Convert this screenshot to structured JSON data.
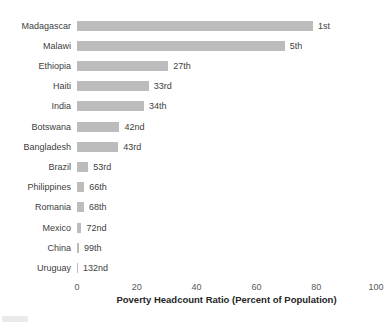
{
  "chart_data": {
    "type": "bar",
    "orientation": "horizontal",
    "title": "",
    "xlabel": "Poverty Headcount Ratio (Percent of Population)",
    "ylabel": "",
    "xlim": [
      0,
      100
    ],
    "x_ticks": [
      0,
      20,
      40,
      60,
      80,
      100
    ],
    "grid": false,
    "legend": false,
    "bar_color": "#bcbcbc",
    "label_color": "#404040",
    "categories": [
      "Madagascar",
      "Malawi",
      "Ethiopia",
      "Haiti",
      "India",
      "Botswana",
      "Bangladesh",
      "Brazil",
      "Philippines",
      "Romania",
      "Mexico",
      "China",
      "Uruguay"
    ],
    "values": [
      78.9,
      69.5,
      30.5,
      24.0,
      22.4,
      14.2,
      13.8,
      3.8,
      2.4,
      2.3,
      1.5,
      0.7,
      0.25
    ],
    "rank_labels": [
      "1st",
      "5th",
      "27th",
      "33rd",
      "34th",
      "42nd",
      "43rd",
      "53rd",
      "66th",
      "68th",
      "72nd",
      "99th",
      "132nd"
    ]
  }
}
